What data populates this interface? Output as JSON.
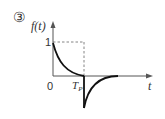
{
  "figure": {
    "index_label": "③",
    "y_axis_label": "f(t)",
    "x_axis_label": "t",
    "origin_label": "0",
    "level_label": "1",
    "tp_label_main": "T",
    "tp_label_sub": "P"
  },
  "colors": {
    "curve": "#111111",
    "axis": "#555555",
    "dashed": "#666666",
    "text": "#333333"
  }
}
